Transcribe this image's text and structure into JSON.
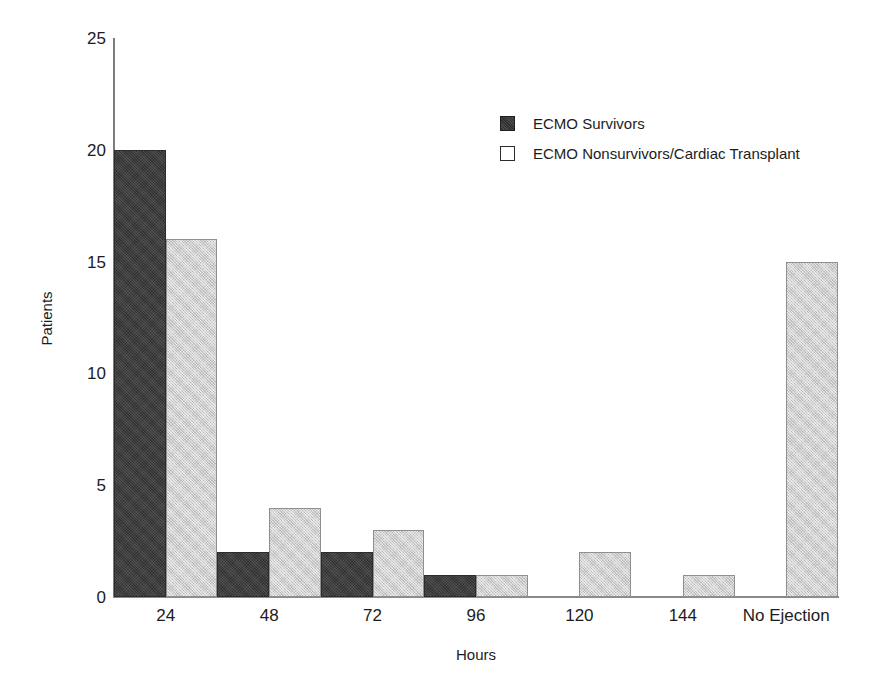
{
  "chart_data": {
    "type": "bar",
    "title": "",
    "xlabel": "Hours",
    "ylabel": "Patients",
    "categories": [
      "24",
      "48",
      "72",
      "96",
      "120",
      "144",
      "No Ejection"
    ],
    "series": [
      {
        "name": "ECMO Survivors",
        "values": [
          20,
          2,
          2,
          1,
          0,
          0,
          0
        ],
        "color": "#3c3c3c"
      },
      {
        "name": "ECMO Nonsurvivors/Cardiac Transplant",
        "values": [
          16,
          4,
          3,
          1,
          2,
          1,
          15
        ],
        "color": "#cfcfcf"
      }
    ],
    "ylim": [
      0,
      25
    ],
    "yticks": [
      "0",
      "5",
      "10",
      "15",
      "20",
      "25"
    ],
    "ytick_values": [
      0,
      5,
      10,
      15,
      20,
      25
    ],
    "grid": false,
    "legend_position": "upper right"
  },
  "legend": {
    "entries": [
      {
        "label": "ECMO Survivors",
        "swatch": "filled-dark-square"
      },
      {
        "label": "ECMO Nonsurvivors/Cardiac Transplant",
        "swatch": "outlined-white-square"
      }
    ]
  }
}
